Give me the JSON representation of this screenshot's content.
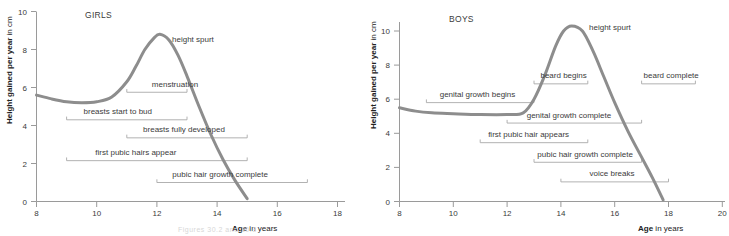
{
  "figure": {
    "caption_faint": "Figures 30.2 and 30.3"
  },
  "chart_data": [
    {
      "type": "line",
      "id": "girls",
      "title": "GIRLS",
      "xlabel_bold": "Age",
      "xlabel_rest": " in years",
      "ylabel_bold": "Height gained per year",
      "ylabel_rest": " in cm",
      "xlim": [
        8,
        18
      ],
      "ylim": [
        0,
        10
      ],
      "xticks": [
        8,
        10,
        12,
        14,
        16,
        18
      ],
      "yticks": [
        0,
        2,
        4,
        6,
        8,
        10
      ],
      "grid": false,
      "annotation": "height spurt",
      "series": [
        {
          "name": "height velocity girls",
          "x": [
            8.0,
            8.5,
            9.0,
            9.5,
            10.0,
            10.5,
            11.0,
            11.3,
            11.6,
            11.9,
            12.1,
            12.4,
            12.7,
            13.0,
            13.4,
            13.8,
            14.2,
            14.6,
            15.0
          ],
          "values": [
            5.6,
            5.4,
            5.25,
            5.2,
            5.25,
            5.5,
            6.3,
            7.1,
            8.0,
            8.6,
            8.8,
            8.5,
            7.7,
            6.6,
            5.0,
            3.5,
            2.2,
            1.1,
            0.15
          ]
        }
      ],
      "events": [
        {
          "label": "menstruation",
          "start": 11,
          "end": 13,
          "y_value": 5.75,
          "label_x": 12.6
        },
        {
          "label": "breasts start to bud",
          "start": 9,
          "end": 13,
          "y_value": 4.3,
          "label_x": 10.7
        },
        {
          "label": "breasts fully developed",
          "start": 11,
          "end": 15,
          "y_value": 3.35,
          "label_x": 12.9
        },
        {
          "label": "first pubic hairs appear",
          "start": 9,
          "end": 15,
          "y_value": 2.15,
          "label_x": 11.3
        },
        {
          "label": "pubic hair growth complete",
          "start": 12,
          "end": 17,
          "y_value": 1.0,
          "label_x": 14.1
        }
      ]
    },
    {
      "type": "line",
      "id": "boys",
      "title": "BOYS",
      "xlabel_bold": "Age",
      "xlabel_rest": " in years",
      "ylabel_bold": "Height gained per year",
      "ylabel_rest": " in cm",
      "xlim": [
        8,
        20
      ],
      "ylim": [
        0,
        11.3
      ],
      "xticks": [
        8,
        10,
        12,
        14,
        16,
        18,
        20
      ],
      "yticks": [
        0,
        2,
        4,
        6,
        8,
        10
      ],
      "grid": false,
      "annotation": "height spurt",
      "series": [
        {
          "name": "height velocity boys",
          "x": [
            8.0,
            8.6,
            9.2,
            10.0,
            11.0,
            12.0,
            12.6,
            13.0,
            13.4,
            13.8,
            14.1,
            14.4,
            14.8,
            15.2,
            15.6,
            16.0,
            16.5,
            17.0,
            17.4,
            17.8
          ],
          "values": [
            5.5,
            5.3,
            5.2,
            5.15,
            5.1,
            5.1,
            5.2,
            6.0,
            7.4,
            9.1,
            10.0,
            10.3,
            10.0,
            8.8,
            7.3,
            5.8,
            4.1,
            2.6,
            1.4,
            0.1
          ]
        }
      ],
      "events": [
        {
          "label": "beard begins",
          "start": 13,
          "end": 15,
          "y_value": 6.9,
          "label_x": 14.1
        },
        {
          "label": "beard complete",
          "start": 17,
          "end": 19,
          "y_value": 6.9,
          "label_x": 18.1
        },
        {
          "label": "genital growth begins",
          "start": 9,
          "end": 13,
          "y_value": 5.8,
          "label_x": 10.9
        },
        {
          "label": "genital growth complete",
          "start": 12,
          "end": 17,
          "y_value": 4.6,
          "label_x": 14.3
        },
        {
          "label": "first pubic hair appears",
          "start": 11,
          "end": 15,
          "y_value": 3.45,
          "label_x": 12.8
        },
        {
          "label": "pubic hair growth complete",
          "start": 13,
          "end": 17,
          "y_value": 2.3,
          "label_x": 14.9
        },
        {
          "label": "voice breaks",
          "start": 14,
          "end": 18,
          "y_value": 1.15,
          "label_x": 15.9
        }
      ]
    }
  ]
}
